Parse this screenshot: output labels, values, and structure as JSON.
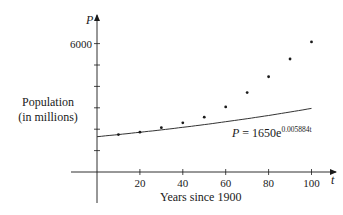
{
  "chart_data": {
    "type": "scatter",
    "title": "",
    "xlabel": "Years since 1900",
    "ylabel": "Population (in millions)",
    "ylabel_lines": [
      "Population",
      "(in millions)"
    ],
    "x_axis_symbol": "t",
    "y_axis_symbol": "P",
    "xlim": [
      -12,
      112
    ],
    "ylim": [
      -1400,
      7200
    ],
    "x_ticks": [
      20,
      40,
      60,
      80,
      100
    ],
    "x_tick_labels": [
      "20",
      "40",
      "60",
      "80",
      "100"
    ],
    "y_ticks": [
      1000,
      2000,
      3000,
      4000,
      5000,
      6000
    ],
    "y_tick_labels": [
      "",
      "",
      "",
      "",
      "",
      "6000"
    ],
    "grid": false,
    "series": [
      {
        "name": "Population data",
        "kind": "scatter",
        "x": [
          10,
          20,
          30,
          40,
          50,
          60,
          70,
          80,
          90,
          100
        ],
        "y": [
          1750,
          1860,
          2070,
          2300,
          2560,
          3040,
          3710,
          4450,
          5280,
          6080
        ]
      },
      {
        "name": "Exponential model",
        "kind": "line",
        "equation": "P = 1650e^{0.005884t}",
        "a": 1650,
        "k": 0.005884,
        "x_range": [
          0,
          100
        ]
      }
    ],
    "annotations": [
      {
        "text": "P = 1650e",
        "superscript": "0.005884t",
        "near_x": 72,
        "near_y": 1900
      }
    ]
  }
}
